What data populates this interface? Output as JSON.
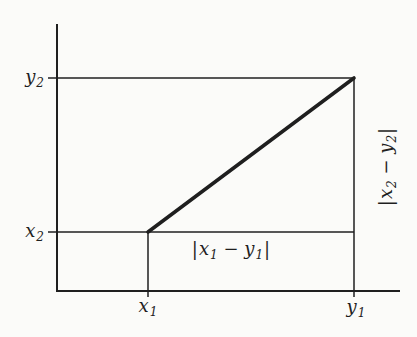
{
  "figure": {
    "colors": {
      "background": "#fbfbf9",
      "line": "#1f1f1f"
    },
    "labels": {
      "y2": {
        "base": "y",
        "sub": "2"
      },
      "x2": {
        "base": "x",
        "sub": "2"
      },
      "x1": {
        "base": "x",
        "sub": "1"
      },
      "y1": {
        "base": "y",
        "sub": "1"
      },
      "horiz_dist": {
        "open": "|",
        "a": "x",
        "a_sub": "1",
        "minus": " − ",
        "b": "y",
        "b_sub": "1",
        "close": "|"
      },
      "vert_dist": {
        "open": "|",
        "a": "x",
        "a_sub": "2",
        "minus": " − ",
        "b": "y",
        "b_sub": "2",
        "close": "|"
      }
    },
    "geometry": {
      "diagonal_from": "(x1, x2-level)",
      "diagonal_to": "(y1, y2-level)",
      "x_axis_ticks": [
        "x1",
        "y1"
      ],
      "y_axis_ticks": [
        "x2",
        "y2"
      ]
    }
  }
}
